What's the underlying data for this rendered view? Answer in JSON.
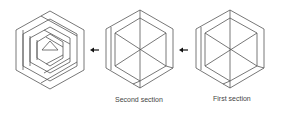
{
  "figures": [
    {
      "id": "final",
      "cx": 50,
      "cy": 50,
      "label": ""
    },
    {
      "id": "second",
      "cx": 140,
      "cy": 50,
      "label": "Second section"
    },
    {
      "id": "first",
      "cx": 230,
      "cy": 50,
      "label": "First section"
    }
  ],
  "arrows": [
    {
      "from": "second",
      "to": "final",
      "direction": "left"
    },
    {
      "from": "first",
      "to": "second",
      "direction": "left"
    }
  ],
  "colors": {
    "line": "#555555",
    "arrow": "#111111",
    "text": "#444444"
  }
}
